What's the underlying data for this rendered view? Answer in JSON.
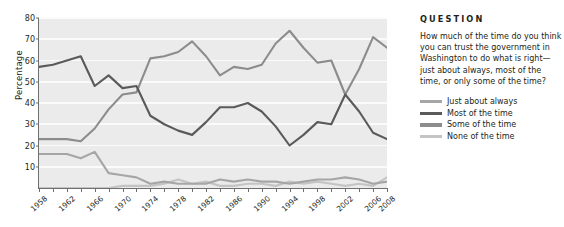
{
  "question": {
    "heading": "QUESTION",
    "text": "How much of the time do you think you can trust the government in Washington to do what is right—just about always, most of the time, or only some of the time?"
  },
  "legend": [
    {
      "label": "Just about always",
      "color": "#a6a6a6"
    },
    {
      "label": "Most of the time",
      "color": "#5a5a5a"
    },
    {
      "label": "Some of the time",
      "color": "#8c8c8c"
    },
    {
      "label": "None of the time",
      "color": "#c4c4c4"
    }
  ],
  "chart_data": {
    "type": "line",
    "title": "",
    "xlabel": "",
    "ylabel": "Percentage",
    "ylim": [
      0,
      80
    ],
    "yticks": [
      0,
      10,
      20,
      30,
      40,
      50,
      60,
      70,
      80
    ],
    "ytick_labels": [
      "",
      "10",
      "20",
      "30",
      "40",
      "50",
      "60",
      "70",
      "80"
    ],
    "grid": true,
    "legend_position": "right",
    "x": [
      1958,
      1960,
      1962,
      1964,
      1966,
      1968,
      1970,
      1972,
      1974,
      1976,
      1978,
      1980,
      1982,
      1984,
      1986,
      1988,
      1990,
      1992,
      1994,
      1996,
      1998,
      2000,
      2002,
      2004,
      2006,
      2008
    ],
    "xtick_labels": [
      "1958",
      "1962",
      "1966",
      "1970",
      "1974",
      "1978",
      "1982",
      "1986",
      "1990",
      "1994",
      "1998",
      "2002",
      "2006",
      "2008"
    ],
    "xticks": [
      1958,
      1962,
      1966,
      1970,
      1974,
      1978,
      1982,
      1986,
      1990,
      1994,
      1998,
      2002,
      2006,
      2008
    ],
    "series": [
      {
        "name": "Most of the time",
        "color": "#5a5a5a",
        "values": [
          57,
          58,
          60,
          62,
          48,
          53,
          47,
          48,
          34,
          30,
          27,
          25,
          31,
          38,
          38,
          40,
          36,
          29,
          20,
          25,
          31,
          30,
          44,
          36,
          26,
          23
        ]
      },
      {
        "name": "Some of the time",
        "color": "#8c8c8c",
        "values": [
          23,
          23,
          23,
          22,
          28,
          37,
          44,
          45,
          61,
          62,
          64,
          69,
          62,
          53,
          57,
          56,
          58,
          68,
          74,
          66,
          59,
          60,
          44,
          56,
          71,
          66
        ]
      },
      {
        "name": "Just about always",
        "color": "#a6a6a6",
        "values": [
          16,
          16,
          16,
          14,
          17,
          7,
          6,
          5,
          2,
          3,
          2,
          2,
          2,
          4,
          3,
          4,
          3,
          3,
          2,
          3,
          4,
          4,
          5,
          4,
          2,
          3
        ]
      },
      {
        "name": "None of the time",
        "color": "#c4c4c4",
        "values": [
          0,
          0,
          0,
          0,
          0,
          0,
          1,
          1,
          1,
          2,
          4,
          2,
          3,
          1,
          1,
          2,
          2,
          1,
          3,
          2,
          3,
          2,
          1,
          2,
          1,
          5
        ]
      }
    ]
  }
}
